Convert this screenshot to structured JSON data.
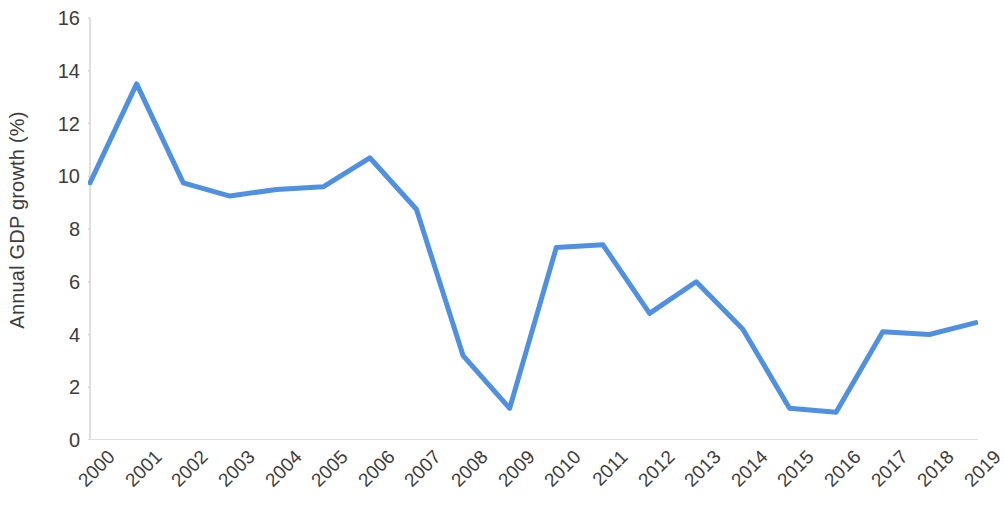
{
  "chart_data": {
    "type": "line",
    "title": "",
    "subtitle": "",
    "xlabel": "",
    "ylabel": "Annual GDP growth (%)",
    "categories": [
      "2000",
      "2001",
      "2002",
      "2003",
      "2004",
      "2005",
      "2006",
      "2007",
      "2008",
      "2009",
      "2010",
      "2011",
      "2012",
      "2013",
      "2014",
      "2015",
      "2016",
      "2017",
      "2018",
      "2019"
    ],
    "values": [
      9.75,
      13.5,
      9.75,
      9.25,
      9.5,
      9.6,
      10.7,
      8.75,
      3.2,
      1.2,
      7.3,
      7.4,
      4.8,
      6.0,
      4.2,
      1.2,
      1.05,
      4.1,
      4.0,
      4.45
    ],
    "series": [
      {
        "name": "Annual GDP growth (%)",
        "values": [
          9.75,
          13.5,
          9.75,
          9.25,
          9.5,
          9.6,
          10.7,
          8.75,
          3.2,
          1.2,
          7.3,
          7.4,
          4.8,
          6.0,
          4.2,
          1.2,
          1.05,
          4.1,
          4.0,
          4.45
        ]
      }
    ],
    "ylim": [
      0,
      16
    ],
    "y_ticks": [
      "16",
      "14",
      "12",
      "10",
      "8",
      "6",
      "4",
      "2",
      "0"
    ],
    "y_tick_values": [
      16,
      14,
      12,
      10,
      8,
      6,
      4,
      2,
      0
    ],
    "xlim_labels": [
      "2000",
      "2019"
    ],
    "grid": false,
    "legend": "none",
    "line_color": "#4f90e0",
    "axis_color": "#d4d4d4",
    "text_color": "#3c3c3c",
    "background": "#ffffff",
    "line_width": 5,
    "x_label_rotation": -45,
    "annotations": []
  }
}
